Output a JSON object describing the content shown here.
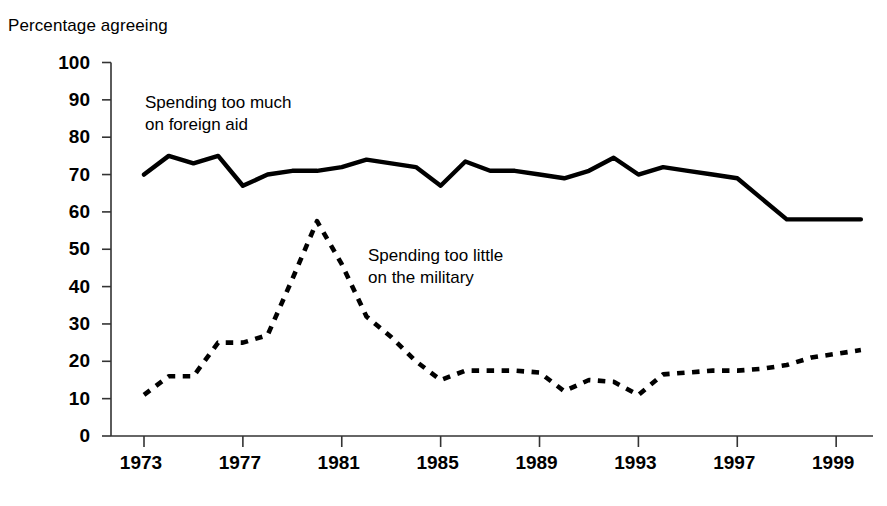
{
  "chart_data": {
    "type": "line",
    "title": "",
    "ylabel": "Percentage agreeing",
    "xlabel": "",
    "ylim": [
      0,
      100
    ],
    "ytick_step": 10,
    "yticks": [
      "100",
      "90",
      "80",
      "70",
      "60",
      "50",
      "40",
      "30",
      "20",
      "10",
      "0"
    ],
    "xticks": [
      "1973",
      "1977",
      "1981",
      "1985",
      "1989",
      "1993",
      "1997",
      "1999"
    ],
    "xtick_values": [
      1973,
      1977,
      1981,
      1985,
      1989,
      1993,
      1997,
      2001
    ],
    "xlim": [
      1973,
      2002
    ],
    "grid": false,
    "legend_position": "inline-annotations",
    "series": [
      {
        "name": "Spending too much on foreign aid",
        "style": "solid",
        "color": "#000000",
        "label_line1": "Spending too much",
        "label_line2": "on foreign aid",
        "x": [
          1973,
          1974,
          1975,
          1976,
          1977,
          1978,
          1979,
          1980,
          1981,
          1982,
          1983,
          1984,
          1985,
          1986,
          1987,
          1988,
          1989,
          1990,
          1991,
          1992,
          1993,
          1994,
          1995,
          1996,
          1997,
          1999,
          2002
        ],
        "values": [
          70,
          75,
          73,
          75,
          67,
          70,
          71,
          71,
          72,
          74,
          73,
          72,
          67,
          73.5,
          71,
          71,
          70,
          69,
          71,
          74.5,
          70,
          72,
          71,
          70,
          69,
          58,
          58
        ]
      },
      {
        "name": "Spending too little on the military",
        "style": "dashed",
        "color": "#000000",
        "label_line1": "Spending too little",
        "label_line2": "on the military",
        "x": [
          1973,
          1974,
          1975,
          1976,
          1977,
          1978,
          1979,
          1980,
          1981,
          1982,
          1983,
          1984,
          1985,
          1986,
          1987,
          1988,
          1989,
          1990,
          1991,
          1992,
          1993,
          1994,
          1995,
          1996,
          1997,
          1998,
          1999,
          2000,
          2002
        ],
        "values": [
          11,
          16,
          16,
          25,
          25,
          27,
          42,
          57.5,
          46,
          32,
          26.5,
          20,
          15,
          17.5,
          17.5,
          17.5,
          17,
          12,
          15,
          14.5,
          11,
          16.5,
          17,
          17.5,
          17.5,
          18,
          19,
          21,
          23
        ]
      }
    ]
  }
}
